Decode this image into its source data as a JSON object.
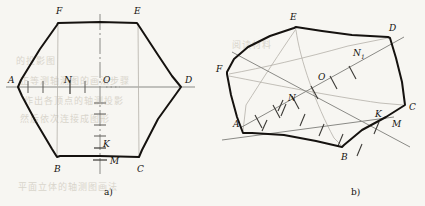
{
  "figure": {
    "caption_a": "a)",
    "caption_b": "b)",
    "background_color": "#f7f6f2",
    "ink_color": "#15120f",
    "axis_color": "#8a8a86",
    "thin_color": "#b4b0a8"
  },
  "panel_a": {
    "name": "orthographic-view",
    "vertex_labels": {
      "A": "A",
      "B": "B",
      "C": "C",
      "D": "D",
      "E": "E",
      "F": "F",
      "O": "O",
      "K": "K",
      "M": "M",
      "N": "N"
    },
    "vertices": {
      "A": [
        18,
        87
      ],
      "F": [
        58,
        23
      ],
      "E": [
        138,
        23
      ],
      "D": [
        181,
        87
      ],
      "C": [
        139,
        157
      ],
      "B": [
        57,
        157
      ]
    },
    "center": [
      100,
      87
    ],
    "point_N": [
      70,
      87
    ],
    "point_K": [
      100,
      148
    ],
    "point_M": [
      100,
      160
    ],
    "h_axis": [
      6,
      87,
      195,
      87
    ],
    "v_axis": [
      100,
      14,
      100,
      176
    ],
    "h_ticks": [
      28,
      43,
      70,
      85
    ],
    "v_ticks": [
      103,
      114,
      125,
      136,
      148,
      160
    ]
  },
  "panel_b": {
    "name": "axonometric-view",
    "vertex_labels": {
      "A": "A",
      "B": "B",
      "C": "C",
      "D": "D",
      "E": "E",
      "F": "F",
      "O": "O",
      "K": "K",
      "M": "M",
      "N": "N",
      "N1": "N",
      "N1_sub": "1"
    },
    "vertices": {
      "E": [
        296,
        27
      ],
      "D": [
        390,
        37
      ],
      "C": [
        405,
        105
      ],
      "M": [
        370,
        133
      ],
      "B": [
        342,
        147
      ],
      "A": [
        243,
        133
      ],
      "F": [
        227,
        72
      ]
    },
    "center": [
      320,
      82
    ],
    "point_N": [
      282,
      101
    ],
    "point_N1": [
      357,
      57
    ],
    "point_K": [
      362,
      114
    ],
    "point_M": [
      378,
      128
    ],
    "axis_x": [
      222,
      139,
      392,
      118
    ],
    "axis_y": [
      232,
      52,
      408,
      146
    ],
    "axis_y_ticks": [
      [
        259,
        120
      ],
      [
        274,
        128
      ],
      [
        289,
        136
      ],
      [
        304,
        144
      ],
      [
        319,
        152
      ],
      [
        334,
        160
      ],
      [
        349,
        168
      ]
    ]
  },
  "bleed_text": [
    {
      "t": "阅读材料",
      "x": 232,
      "y": 44
    },
    {
      "t": "的投影图",
      "x": 16,
      "y": 60
    },
    {
      "t": "正等测轴测图的画法步骤",
      "x": 20,
      "y": 80
    },
    {
      "t": "作出各顶点的轴测投影",
      "x": 24,
      "y": 100
    },
    {
      "t": "然后依次连接成图形",
      "x": 20,
      "y": 118
    },
    {
      "t": "平面立体的轴测图画法",
      "x": 18,
      "y": 186
    }
  ]
}
